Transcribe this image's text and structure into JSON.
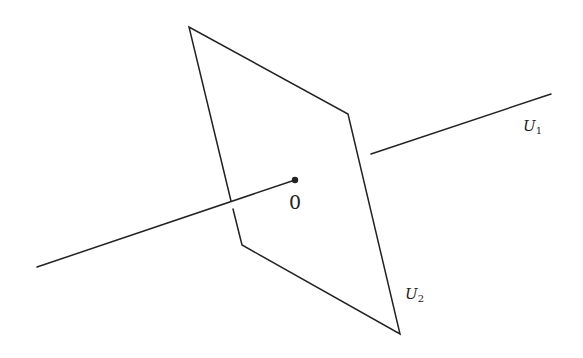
{
  "diagram": {
    "type": "geometric-illustration",
    "colors": {
      "stroke": "#222222",
      "background": "#ffffff"
    },
    "plane": {
      "vertices": [
        [
          189,
          27
        ],
        [
          348,
          114
        ],
        [
          400,
          334
        ],
        [
          242,
          245
        ]
      ]
    },
    "line_front_segment": {
      "from": [
        37,
        267
      ],
      "to": [
        295,
        180
      ]
    },
    "line_back_segment": {
      "from": [
        371,
        154
      ],
      "to": [
        551,
        94
      ]
    },
    "origin": {
      "point": [
        295,
        180
      ],
      "label": "0"
    },
    "labels": {
      "u1": {
        "base": "U",
        "subscript": "1"
      },
      "u2": {
        "base": "U",
        "subscript": "2"
      }
    }
  }
}
